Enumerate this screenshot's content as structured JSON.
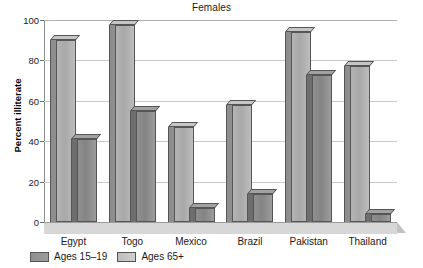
{
  "chart_data": {
    "type": "bar",
    "title": "Females",
    "xlabel": "",
    "ylabel": "Percent illiterate",
    "ylim": [
      0,
      100
    ],
    "yticks": [
      0,
      20,
      40,
      60,
      80,
      100
    ],
    "grid": true,
    "legend_position": "bottom-left",
    "categories": [
      "Egypt",
      "Togo",
      "Mexico",
      "Brazil",
      "Pakistan",
      "Thailand"
    ],
    "series": [
      {
        "name": "Ages 65+",
        "swatch": "light",
        "values": [
          90,
          97.5,
          47,
          58,
          94,
          77
        ]
      },
      {
        "name": "Ages 15–19",
        "swatch": "dark",
        "values": [
          41,
          55,
          7,
          14,
          73,
          4
        ]
      }
    ],
    "legend": [
      {
        "label": "Ages 15–19",
        "swatch": "dark"
      },
      {
        "label": "Ages 65+",
        "swatch": "light"
      }
    ]
  },
  "colors": {
    "bar_light": "#b4b4b4",
    "bar_dark": "#8f8f8f",
    "grid": "#c9c9c9",
    "axis": "#8a8a8a",
    "floor": "#d7d7d7",
    "text": "#1a1a1a"
  },
  "yticks_text": [
    "0",
    "20",
    "40",
    "60",
    "80",
    "100"
  ]
}
